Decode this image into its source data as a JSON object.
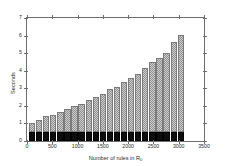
{
  "chart_data": {
    "type": "bar",
    "title": "",
    "subtitle": "",
    "xlabel": "Number of rules in R",
    "xlabel_subscript": "0",
    "ylabel": "Seconds",
    "xlim": [
      0,
      3500
    ],
    "ylim": [
      0,
      7
    ],
    "xticks": [
      0,
      500,
      1000,
      1500,
      2000,
      2500,
      3000,
      3500
    ],
    "yticks": [
      0,
      1,
      2,
      3,
      4,
      5,
      6,
      7
    ],
    "grid": false,
    "stacked": true,
    "legend_position": "top-center",
    "legend": [
      {
        "name": "Mining",
        "swatch": "hatched-light-gray"
      },
      {
        "name": "Preprocessing",
        "swatch": "solid-black"
      }
    ],
    "x": [
      100,
      240,
      380,
      520,
      660,
      800,
      940,
      1080,
      1220,
      1360,
      1500,
      1640,
      1780,
      1920,
      2060,
      2200,
      2340,
      2480,
      2620,
      2760,
      2900,
      3040
    ],
    "series": [
      {
        "name": "Preprocessing",
        "values": [
          0.5,
          0.5,
          0.5,
          0.5,
          0.5,
          0.5,
          0.5,
          0.5,
          0.5,
          0.5,
          0.5,
          0.5,
          0.5,
          0.5,
          0.5,
          0.5,
          0.5,
          0.5,
          0.5,
          0.5,
          0.5,
          0.5
        ]
      },
      {
        "name": "Mining",
        "values": [
          0.5,
          0.7,
          0.9,
          1.0,
          1.15,
          1.3,
          1.5,
          1.6,
          1.85,
          2.0,
          2.2,
          2.45,
          2.6,
          2.85,
          3.1,
          3.3,
          3.65,
          4.0,
          4.25,
          4.5,
          5.15,
          5.55
        ]
      }
    ],
    "totals": [
      1.0,
      1.2,
      1.4,
      1.5,
      1.65,
      1.8,
      2.0,
      2.1,
      2.35,
      2.5,
      2.7,
      2.95,
      3.1,
      3.35,
      3.6,
      3.8,
      4.15,
      4.5,
      4.75,
      5.0,
      5.65,
      6.05
    ]
  },
  "colors": {
    "mining_fill": "#cfcfcf",
    "mining_hatch": "#8f8f8f",
    "preprocessing_fill": "#0d0d0d",
    "axis": "#6d6d6d",
    "text": "#2b2b2b",
    "background": "#ffffff"
  }
}
